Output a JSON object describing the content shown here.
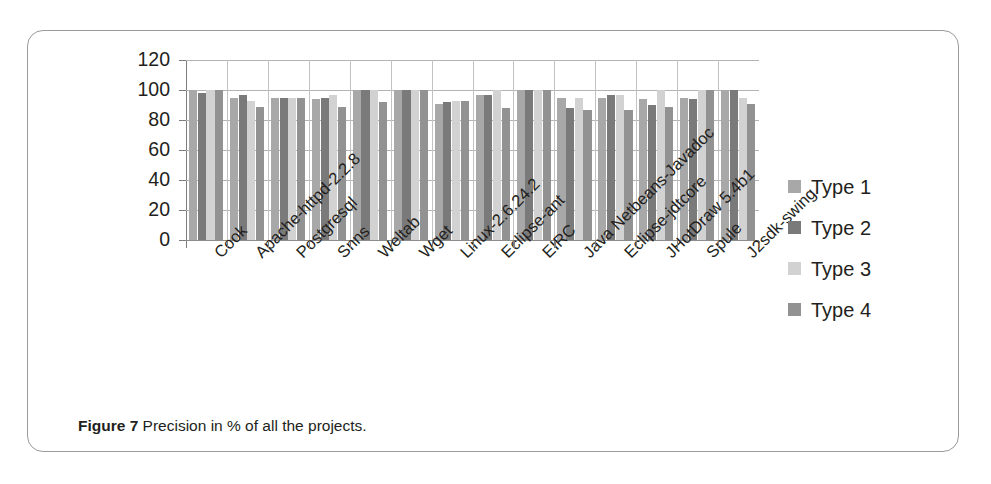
{
  "caption": {
    "bold_prefix": "Figure 7",
    "text": " Precision in % of all the projects."
  },
  "legend": {
    "position": "right",
    "items": [
      {
        "label": "Type 1",
        "color": "#a8a8a8",
        "key": "t1"
      },
      {
        "label": "Type 2",
        "color": "#7a7a7a",
        "key": "t2"
      },
      {
        "label": "Type 3",
        "color": "#d2d2d2",
        "key": "t3"
      },
      {
        "label": "Type 4",
        "color": "#929292",
        "key": "t4"
      }
    ]
  },
  "axis": {
    "y_ticks": [
      "120",
      "100",
      "80",
      "60",
      "40",
      "20",
      "0"
    ]
  },
  "chart_data": {
    "type": "bar",
    "title": "Precision in % of all the projects.",
    "xlabel": "",
    "ylabel": "",
    "ylim": [
      0,
      120
    ],
    "ytick_step": 20,
    "grid": true,
    "legend_position": "right",
    "categories": [
      "Cook",
      "Apache-httpd-2.2.8",
      "Postgresql",
      "Snns",
      "Weltab",
      "Wget",
      "Linux-2.6.24.2",
      "Eclipse-ant",
      "EIRC",
      "Java Netbeans-Javadoc",
      "Eclipse-jdtcore",
      "JHotDraw 5.4b1",
      "Spule",
      "J2sdk-swing"
    ],
    "series": [
      {
        "name": "Type 1",
        "color": "#a8a8a8",
        "values": [
          100,
          95,
          95,
          94,
          100,
          100,
          91,
          97,
          100,
          95,
          95,
          94,
          95,
          100
        ]
      },
      {
        "name": "Type 2",
        "color": "#7a7a7a",
        "values": [
          98,
          97,
          95,
          95,
          100,
          100,
          92,
          97,
          100,
          88,
          97,
          90,
          94,
          100
        ]
      },
      {
        "name": "Type 3",
        "color": "#d2d2d2",
        "values": [
          100,
          93,
          95,
          97,
          100,
          100,
          93,
          100,
          100,
          95,
          97,
          100,
          100,
          95
        ]
      },
      {
        "name": "Type 4",
        "color": "#929292",
        "values": [
          100,
          89,
          95,
          89,
          92,
          100,
          93,
          88,
          100,
          87,
          87,
          89,
          100,
          91
        ]
      }
    ]
  }
}
